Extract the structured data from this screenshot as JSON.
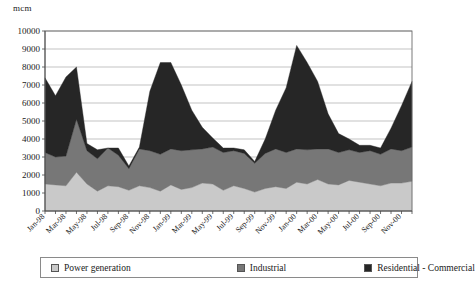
{
  "chart_data": {
    "type": "area",
    "stacked": true,
    "title": "",
    "xlabel": "",
    "ylabel": "mcm",
    "unit_label": "mcm",
    "ylim": [
      0,
      10000
    ],
    "ytick_step": 1000,
    "ytick_labels": [
      "0",
      "1000",
      "2000",
      "3000",
      "4000",
      "5000",
      "6000",
      "7000",
      "8000",
      "9000",
      "10000"
    ],
    "grid": true,
    "legend_position": "bottom",
    "x": [
      "Jan-98",
      "Feb-98",
      "Mar-98",
      "Apr-98",
      "May-98",
      "Jun-98",
      "Jul-98",
      "Aug-98",
      "Sep-98",
      "Oct-98",
      "Nov-98",
      "Dec-98",
      "Jan-99",
      "Feb-99",
      "Mar-99",
      "Apr-99",
      "May-99",
      "Jun-99",
      "Jul-99",
      "Aug-99",
      "Sep-99",
      "Oct-99",
      "Nov-99",
      "Dec-99",
      "Jan-00",
      "Feb-00",
      "Mar-00",
      "Apr-00",
      "May-00",
      "Jun-00",
      "Jul-00",
      "Aug-00",
      "Sep-00",
      "Oct-00",
      "Nov-00",
      "Dec-00"
    ],
    "xtick_labels": [
      "Jan-98",
      "Mar-98",
      "May-98",
      "Jul-98",
      "Sep-98",
      "Nov-98",
      "Jan-99",
      "Mar-99",
      "May-99",
      "Jul-99",
      "Sep-99",
      "Nov-99",
      "Jan-00",
      "Mar-00",
      "May-00",
      "Jul-00",
      "Sep-00",
      "Nov-00"
    ],
    "categories": [
      "Jan-98",
      "Feb-98",
      "Mar-98",
      "Apr-98",
      "May-98",
      "Jun-98",
      "Jul-98",
      "Aug-98",
      "Sep-98",
      "Oct-98",
      "Nov-98",
      "Dec-98",
      "Jan-99",
      "Feb-99",
      "Mar-99",
      "Apr-99",
      "May-99",
      "Jun-99",
      "Jul-99",
      "Aug-99",
      "Sep-99",
      "Oct-99",
      "Nov-99",
      "Dec-99",
      "Jan-00",
      "Feb-00",
      "Mar-00",
      "Apr-00",
      "May-00",
      "Jun-00",
      "Jul-00",
      "Aug-00",
      "Sep-00",
      "Oct-00",
      "Nov-00",
      "Dec-00"
    ],
    "series": [
      {
        "name": "Power generation",
        "color": "#c9c9c9",
        "values": [
          1500,
          1450,
          1400,
          2150,
          1500,
          1100,
          1400,
          1350,
          1150,
          1400,
          1300,
          1100,
          1450,
          1200,
          1300,
          1550,
          1500,
          1150,
          1400,
          1250,
          1050,
          1250,
          1350,
          1250,
          1600,
          1500,
          1750,
          1500,
          1450,
          1700,
          1600,
          1500,
          1400,
          1550,
          1550,
          1650
        ]
      },
      {
        "name": "Industrial",
        "color": "#777777",
        "values": [
          1750,
          1550,
          1650,
          2950,
          1850,
          1800,
          2100,
          1750,
          1200,
          2050,
          2050,
          2050,
          2000,
          2150,
          2100,
          1900,
          2050,
          2100,
          1950,
          1950,
          1600,
          1950,
          2100,
          2000,
          1850,
          1900,
          1700,
          1950,
          1800,
          1700,
          1650,
          1850,
          1750,
          1900,
          1800,
          1900
        ]
      },
      {
        "name": "Residential - Commercial",
        "color": "#262626",
        "values": [
          4150,
          3400,
          4400,
          2900,
          400,
          500,
          0,
          400,
          150,
          100,
          3300,
          5100,
          4800,
          3650,
          2200,
          1200,
          500,
          250,
          150,
          200,
          100,
          800,
          2150,
          3600,
          5750,
          4850,
          3750,
          1950,
          1050,
          600,
          400,
          300,
          350,
          1150,
          2500,
          3650
        ]
      }
    ],
    "peaks": [
      {
        "x": "Jan-98",
        "total": 7400
      },
      {
        "x": "Apr-98",
        "total": 8000
      },
      {
        "x": "Dec-98",
        "total": 8250
      },
      {
        "x": "Jan-00",
        "total": 9200
      },
      {
        "x": "Dec-00",
        "total": 7200
      }
    ]
  },
  "legend": {
    "items": [
      {
        "label": "Power generation",
        "color": "#c9c9c9"
      },
      {
        "label": "Industrial",
        "color": "#777777"
      },
      {
        "label": "Residential - Commercial",
        "color": "#262626"
      }
    ]
  }
}
